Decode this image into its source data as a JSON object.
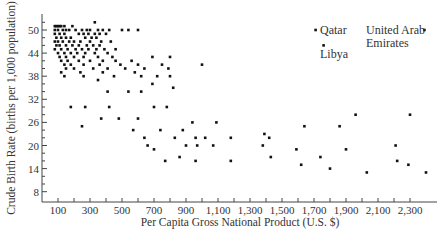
{
  "chart_data": {
    "type": "scatter",
    "title": "",
    "xlabel": "Per Capita Gross National Product (U.S. $)",
    "ylabel": "Crude Birth Rate (births per 1,000 population)",
    "xlim": [
      0,
      2450
    ],
    "ylim": [
      6,
      53
    ],
    "x_ticks": [
      100,
      300,
      500,
      700,
      900,
      1100,
      1300,
      1500,
      1700,
      1900,
      2100,
      2300
    ],
    "x_tick_labels": [
      "100",
      "300",
      "500",
      "700",
      "900",
      "1,100",
      "1,300",
      "1,500",
      "1,700",
      "1,900",
      "2,100",
      "2,300"
    ],
    "y_ticks": [
      8,
      14,
      20,
      26,
      32,
      38,
      44,
      50
    ],
    "y_tick_labels": [
      "8",
      "14",
      "20",
      "26",
      "32",
      "38",
      "44",
      "50"
    ],
    "grid": false,
    "legend": null,
    "annotations": [
      {
        "text": "Qatar",
        "x": 1700,
        "y": 50
      },
      {
        "text": "Libya",
        "x": 1750,
        "y": 46
      },
      {
        "text": "United Arab Emirates",
        "x": 2380,
        "y": 50
      }
    ],
    "points": [
      [
        80,
        51
      ],
      [
        90,
        51
      ],
      [
        100,
        51
      ],
      [
        110,
        51
      ],
      [
        120,
        51
      ],
      [
        140,
        51
      ],
      [
        190,
        51
      ],
      [
        330,
        52
      ],
      [
        80,
        50
      ],
      [
        100,
        50
      ],
      [
        130,
        50
      ],
      [
        150,
        50
      ],
      [
        170,
        50
      ],
      [
        210,
        50
      ],
      [
        250,
        50
      ],
      [
        280,
        50
      ],
      [
        300,
        50
      ],
      [
        350,
        50
      ],
      [
        380,
        50
      ],
      [
        420,
        50
      ],
      [
        500,
        50
      ],
      [
        540,
        50
      ],
      [
        600,
        50
      ],
      [
        80,
        49
      ],
      [
        110,
        49
      ],
      [
        140,
        49
      ],
      [
        230,
        49
      ],
      [
        260,
        49
      ],
      [
        290,
        49
      ],
      [
        330,
        49
      ],
      [
        360,
        49
      ],
      [
        400,
        49
      ],
      [
        90,
        48
      ],
      [
        120,
        48
      ],
      [
        150,
        48
      ],
      [
        180,
        48
      ],
      [
        270,
        48
      ],
      [
        310,
        48
      ],
      [
        340,
        48
      ],
      [
        80,
        47
      ],
      [
        100,
        47
      ],
      [
        130,
        47
      ],
      [
        170,
        47
      ],
      [
        200,
        47
      ],
      [
        240,
        47
      ],
      [
        300,
        47
      ],
      [
        370,
        47
      ],
      [
        430,
        47
      ],
      [
        90,
        46
      ],
      [
        110,
        46
      ],
      [
        150,
        46
      ],
      [
        190,
        46
      ],
      [
        230,
        46
      ],
      [
        280,
        46
      ],
      [
        320,
        46
      ],
      [
        360,
        46
      ],
      [
        80,
        45
      ],
      [
        120,
        45
      ],
      [
        160,
        45
      ],
      [
        210,
        45
      ],
      [
        250,
        45
      ],
      [
        290,
        45
      ],
      [
        340,
        45
      ],
      [
        390,
        45
      ],
      [
        460,
        45
      ],
      [
        100,
        44
      ],
      [
        140,
        44
      ],
      [
        180,
        44
      ],
      [
        220,
        44
      ],
      [
        270,
        44
      ],
      [
        330,
        44
      ],
      [
        410,
        44
      ],
      [
        110,
        43
      ],
      [
        150,
        43
      ],
      [
        200,
        43
      ],
      [
        260,
        43
      ],
      [
        350,
        43
      ],
      [
        440,
        43
      ],
      [
        690,
        43
      ],
      [
        800,
        43
      ],
      [
        120,
        42
      ],
      [
        160,
        42
      ],
      [
        230,
        42
      ],
      [
        300,
        42
      ],
      [
        380,
        42
      ],
      [
        460,
        42
      ],
      [
        560,
        42
      ],
      [
        140,
        41
      ],
      [
        180,
        41
      ],
      [
        260,
        41
      ],
      [
        360,
        41
      ],
      [
        490,
        41
      ],
      [
        600,
        41
      ],
      [
        750,
        41
      ],
      [
        1000,
        41
      ],
      [
        150,
        40
      ],
      [
        200,
        40
      ],
      [
        320,
        40
      ],
      [
        410,
        40
      ],
      [
        520,
        40
      ],
      [
        640,
        40
      ],
      [
        790,
        40
      ],
      [
        120,
        39
      ],
      [
        240,
        39
      ],
      [
        380,
        39
      ],
      [
        580,
        39
      ],
      [
        140,
        38
      ],
      [
        260,
        38
      ],
      [
        450,
        38
      ],
      [
        620,
        38
      ],
      [
        720,
        38
      ],
      [
        800,
        38
      ],
      [
        350,
        37
      ],
      [
        690,
        36
      ],
      [
        820,
        35
      ],
      [
        410,
        34
      ],
      [
        540,
        34
      ],
      [
        620,
        34
      ],
      [
        180,
        30
      ],
      [
        270,
        30
      ],
      [
        420,
        30
      ],
      [
        700,
        30
      ],
      [
        780,
        30
      ],
      [
        370,
        27
      ],
      [
        480,
        27
      ],
      [
        600,
        27
      ],
      [
        940,
        26
      ],
      [
        1090,
        26
      ],
      [
        250,
        25
      ],
      [
        570,
        24
      ],
      [
        740,
        24
      ],
      [
        880,
        24
      ],
      [
        1640,
        25
      ],
      [
        1960,
        28
      ],
      [
        2300,
        28
      ],
      [
        640,
        22
      ],
      [
        830,
        22
      ],
      [
        960,
        22
      ],
      [
        1020,
        22
      ],
      [
        1180,
        22
      ],
      [
        1390,
        23
      ],
      [
        1420,
        22
      ],
      [
        1860,
        25
      ],
      [
        660,
        20
      ],
      [
        900,
        20
      ],
      [
        970,
        20
      ],
      [
        1070,
        20
      ],
      [
        1380,
        20
      ],
      [
        2210,
        20
      ],
      [
        700,
        19
      ],
      [
        1590,
        19
      ],
      [
        1900,
        19
      ],
      [
        860,
        17
      ],
      [
        1430,
        17
      ],
      [
        1740,
        17
      ],
      [
        770,
        16
      ],
      [
        960,
        16
      ],
      [
        1180,
        16
      ],
      [
        1620,
        15
      ],
      [
        2220,
        16
      ],
      [
        2290,
        15
      ],
      [
        1800,
        14
      ],
      [
        2030,
        13
      ],
      [
        2400,
        13
      ],
      [
        1710,
        50
      ],
      [
        1760,
        46
      ],
      [
        2390,
        50
      ]
    ]
  },
  "labels": {
    "ylabel": "Crude Birth Rate (births per 1,000 population)",
    "xlabel": "Per Capita Gross National Product (U.S. $)",
    "qatar": "Qatar",
    "libya": "Libya",
    "uae_line1": "United Arab",
    "uae_line2": "Emirates"
  }
}
